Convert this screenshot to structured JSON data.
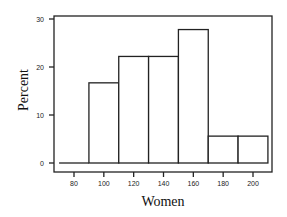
{
  "chart_data": {
    "type": "bar",
    "subtype": "histogram",
    "title": "",
    "xlabel": "Women",
    "ylabel": "Percent",
    "bins": [
      {
        "start": 70,
        "end": 90,
        "value": 0
      },
      {
        "start": 90,
        "end": 110,
        "value": 16.7
      },
      {
        "start": 110,
        "end": 130,
        "value": 22.2
      },
      {
        "start": 130,
        "end": 150,
        "value": 22.2
      },
      {
        "start": 150,
        "end": 170,
        "value": 27.8
      },
      {
        "start": 170,
        "end": 190,
        "value": 5.6
      },
      {
        "start": 190,
        "end": 210,
        "value": 5.6
      }
    ],
    "categories": [
      "70-90",
      "90-110",
      "110-130",
      "130-150",
      "150-170",
      "170-190",
      "190-210"
    ],
    "values": [
      0,
      16.7,
      22.2,
      22.2,
      27.8,
      5.6,
      5.6
    ],
    "xticks": [
      80,
      100,
      120,
      140,
      160,
      180,
      200
    ],
    "yticks": [
      0,
      10,
      20,
      30
    ],
    "xlim": [
      66,
      212
    ],
    "ylim": [
      -1.5,
      30.5
    ],
    "grid": false,
    "legend": null
  }
}
